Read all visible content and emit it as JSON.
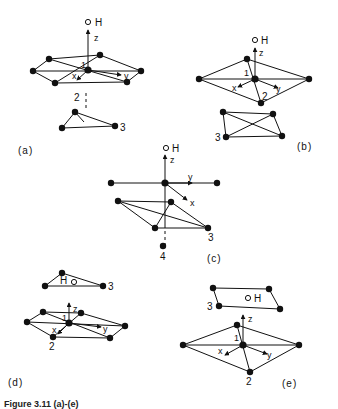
{
  "figure": {
    "caption": "Figure 3.11 (a)-(e)",
    "caption_note": "Caption is partially cut off at the bottom edge of the image; text is an approximate reading."
  },
  "panels": [
    {
      "id": "a",
      "label": "(a)",
      "atom_labels": [
        "O",
        "H",
        "1",
        "2",
        "3"
      ],
      "axes": [
        "x",
        "y",
        "z"
      ]
    },
    {
      "id": "b",
      "label": "(b)",
      "atom_labels": [
        "O",
        "H",
        "1",
        "2",
        "3"
      ],
      "axes": [
        "x",
        "y",
        "z"
      ]
    },
    {
      "id": "c",
      "label": "(c)",
      "atom_labels": [
        "O",
        "H",
        "3",
        "4"
      ],
      "axes": [
        "x",
        "y",
        "z"
      ]
    },
    {
      "id": "d",
      "label": "(d)",
      "atom_labels": [
        "H",
        "O",
        "1",
        "2",
        "3"
      ],
      "axes": [
        "x",
        "y",
        "z"
      ]
    },
    {
      "id": "e",
      "label": "(e)",
      "atom_labels": [
        "O",
        "H",
        "1",
        "2",
        "3"
      ],
      "axes": [
        "x",
        "y",
        "z"
      ]
    }
  ],
  "labels": {
    "O": "O",
    "H": "H",
    "x": "x",
    "y": "y",
    "z": "z",
    "one": "1",
    "two": "2",
    "three": "3",
    "four": "4",
    "pa": "(a)",
    "pb": "(b)",
    "pc": "(c)",
    "pd": "(d)",
    "pe": "(e)"
  }
}
